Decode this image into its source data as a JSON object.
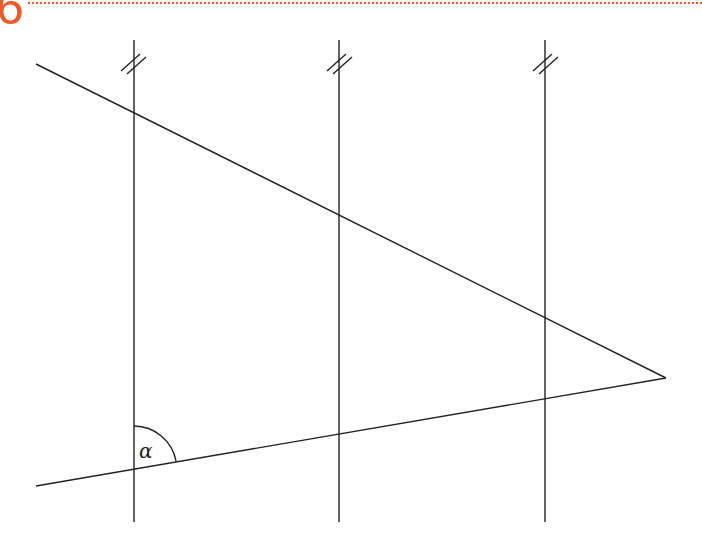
{
  "header": {
    "number": "6",
    "accent_color": "#ee5a2c"
  },
  "diagram": {
    "angle_label": "α",
    "parallel_marks": "//",
    "line_color": "#222222",
    "verticals_x": [
      134,
      339,
      545
    ],
    "upper_line": {
      "from": [
        36,
        64
      ],
      "to": [
        666,
        378
      ]
    },
    "lower_line": {
      "from": [
        36,
        486
      ],
      "to": [
        666,
        378
      ]
    }
  }
}
